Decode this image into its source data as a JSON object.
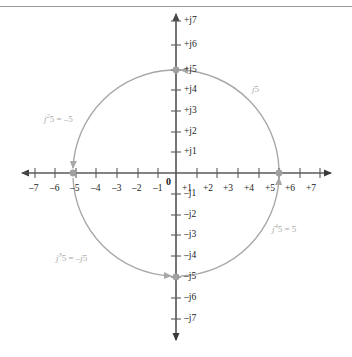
{
  "figure": {
    "origin_label": "0",
    "colors": {
      "axis": "#5a5a5a",
      "tick_text": "#1a1a1a",
      "arc": "#a8a8a8",
      "annotation_text": "#a8a8a8",
      "marker": "#a0a0a0",
      "rule": "#9a9a9a",
      "background": "#ffffff"
    }
  },
  "chart_data": {
    "type": "scatter",
    "xlabel": "Real axis",
    "ylabel": "Imaginary axis",
    "xlim": [
      -7.6,
      7.6
    ],
    "ylim": [
      -7.6,
      7.6
    ],
    "grid": false,
    "legend_position": "none",
    "real_axis_ticks": [
      "-7",
      "-6",
      "-5",
      "-4",
      "-3",
      "-2",
      "-1",
      "+1",
      "+2",
      "+3",
      "+4",
      "+5",
      "+6",
      "+7"
    ],
    "real_axis_tick_values": [
      -7,
      -6,
      -5,
      -4,
      -3,
      -2,
      -1,
      1,
      2,
      3,
      4,
      5,
      6,
      7
    ],
    "imag_axis_ticks_positive": [
      "+j1",
      "+j2",
      "+j3",
      "+j4",
      "+j5",
      "+j6",
      "+j7"
    ],
    "imag_axis_tick_values_positive": [
      1,
      2,
      3,
      4,
      5,
      6,
      7
    ],
    "imag_axis_ticks_negative": [
      "-j1",
      "-j2",
      "-j3",
      "-j4",
      "-j5",
      "-j6",
      "-j7"
    ],
    "imag_axis_tick_values_negative": [
      -1,
      -2,
      -3,
      -4,
      -5,
      -6,
      -7
    ],
    "circle_radius": 5,
    "points": [
      {
        "name": "plus-five",
        "x": 5,
        "y": 0,
        "label": "+5"
      },
      {
        "name": "plus-j-five",
        "x": 0,
        "y": 5,
        "label": "+j5"
      },
      {
        "name": "minus-five",
        "x": -5,
        "y": 0,
        "label": "-5"
      },
      {
        "name": "minus-j-five",
        "x": 0,
        "y": -5,
        "label": "-j5"
      }
    ],
    "arcs": [
      {
        "name": "arc-j5",
        "from": [
          5,
          0
        ],
        "to": [
          0,
          5
        ],
        "quadrant": "upper-right",
        "label": "j5"
      },
      {
        "name": "arc-j2-5",
        "from": [
          0,
          5
        ],
        "to": [
          -5,
          0
        ],
        "quadrant": "upper-left",
        "label": "j²5 = –5"
      },
      {
        "name": "arc-j3-5",
        "from": [
          -5,
          0
        ],
        "to": [
          0,
          -5
        ],
        "quadrant": "lower-left",
        "label": "j³5 = –j5"
      },
      {
        "name": "arc-j4-5",
        "from": [
          0,
          -5
        ],
        "to": [
          5,
          0
        ],
        "quadrant": "lower-right",
        "label": "j⁴5 = 5"
      }
    ]
  },
  "axis_labels": {
    "real_negative": [
      {
        "text": "–7",
        "x": 29,
        "y": 183
      },
      {
        "text": "–6",
        "x": 50,
        "y": 183
      },
      {
        "text": "–5",
        "x": 70,
        "y": 183
      },
      {
        "text": "–4",
        "x": 91,
        "y": 183
      },
      {
        "text": "–3",
        "x": 112,
        "y": 183
      },
      {
        "text": "–2",
        "x": 132,
        "y": 183
      },
      {
        "text": "–1",
        "x": 153,
        "y": 183
      }
    ],
    "real_positive": [
      {
        "text": "+1",
        "x": 182,
        "y": 183
      },
      {
        "text": "+2",
        "x": 203,
        "y": 183
      },
      {
        "text": "+3",
        "x": 223,
        "y": 183
      },
      {
        "text": "+4",
        "x": 244,
        "y": 183
      },
      {
        "text": "+5",
        "x": 265,
        "y": 183
      },
      {
        "text": "+6",
        "x": 285,
        "y": 183
      },
      {
        "text": "+7",
        "x": 306,
        "y": 183
      }
    ],
    "imag_positive": [
      {
        "text": "+j7",
        "x": 182,
        "y": 15
      },
      {
        "text": "+j6",
        "x": 182,
        "y": 38
      },
      {
        "text": "+j5",
        "x": 182,
        "y": 62
      },
      {
        "text": "+j4",
        "x": 182,
        "y": 83
      },
      {
        "text": "+j3",
        "x": 182,
        "y": 104
      },
      {
        "text": "+j2",
        "x": 182,
        "y": 125
      },
      {
        "text": "+j1",
        "x": 182,
        "y": 146
      }
    ],
    "imag_negative": [
      {
        "text": "–j1",
        "x": 182,
        "y": 190
      },
      {
        "text": "–j2",
        "x": 182,
        "y": 211
      },
      {
        "text": "–j3",
        "x": 182,
        "y": 232
      },
      {
        "text": "–j4",
        "x": 182,
        "y": 253
      },
      {
        "text": "–j5",
        "x": 182,
        "y": 274
      },
      {
        "text": "–j6",
        "x": 182,
        "y": 295
      },
      {
        "text": "–j7",
        "x": 182,
        "y": 316
      }
    ]
  },
  "annotations": [
    {
      "name": "annotation-j5",
      "html": "<i>j</i>5",
      "x": 252,
      "y": 84
    },
    {
      "name": "annotation-j2-5",
      "html": "<i>j</i><sup>2</sup>5 = –5",
      "x": 44,
      "y": 112
    },
    {
      "name": "annotation-j3-5",
      "html": "<i>j</i><sup>3</sup>5 = –<i>j</i>5",
      "x": 56,
      "y": 251
    },
    {
      "name": "annotation-j4-5",
      "html": "<i>j</i><sup>4</sup>5 = 5",
      "x": 272,
      "y": 222
    }
  ]
}
